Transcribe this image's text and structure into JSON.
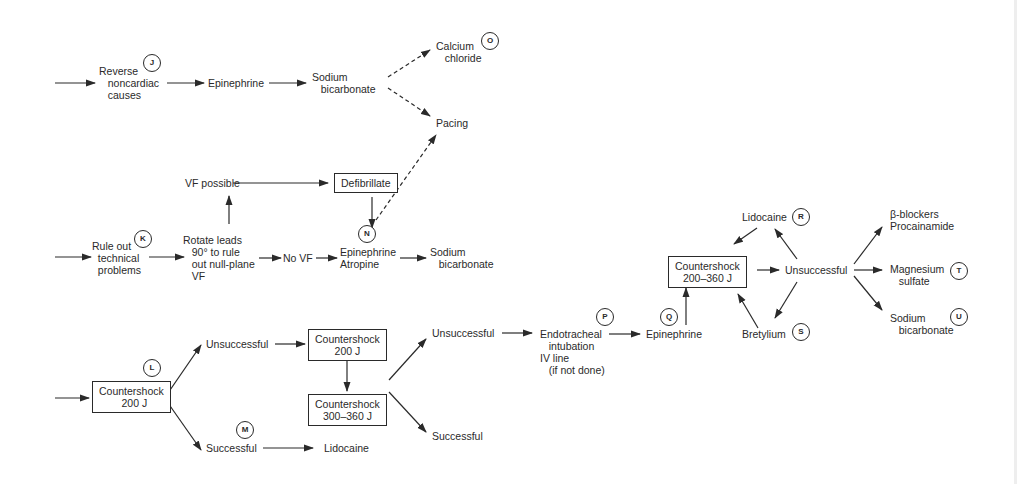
{
  "diagram": {
    "nodes": {
      "reverse_noncardiac": "Reverse\n   noncardiac\n   causes",
      "epinephrine_top": "Epinephrine",
      "sodium_bicarb_top": "Sodium\n   bicarbonate",
      "calcium_chloride": "Calcium\n   chloride",
      "pacing": "Pacing",
      "rule_out": "Rule out\n  technical\n  problems",
      "vf_possible": "VF possible",
      "defibrillate": "Defibrillate",
      "rotate_leads": "Rotate leads\n   90° to rule\n   out null-plane\n   VF",
      "no_vf": "No VF",
      "epi_atropine": "Epinephrine\nAtropine",
      "sodium_bicarb_mid": "Sodium\n   bicarbonate",
      "countershock_200_first": "Countershock\n  200 J",
      "unsuccessful_1": "Unsuccessful",
      "successful_1": "Successful",
      "lidocaine_bottom": "Lidocaine",
      "countershock_200_second": "Countershock\n200 J",
      "countershock_300_360": "Countershock\n300–360 J",
      "unsuccessful_2": "Unsuccessful",
      "successful_2": "Successful",
      "endotracheal": "Endotracheal\n   intubation\nIV line\n   (if not done)",
      "epinephrine_q": "Epinephrine",
      "countershock_200_360": "Countershock\n200–360 J",
      "lidocaine_r": "Lidocaine",
      "unsuccessful_3": "Unsuccessful",
      "bretylium": "Bretylium",
      "beta_blockers": "β-blockers\nProcainamide",
      "magnesium_sulfate": "Magnesium\n   sulfate",
      "sodium_bicarb_u": "Sodium\n   bicarbonate"
    },
    "badges": {
      "J": "J",
      "K": "K",
      "L": "L",
      "M": "M",
      "N": "N",
      "O": "O",
      "P": "P",
      "Q": "Q",
      "R": "R",
      "S": "S",
      "T": "T",
      "U": "U"
    },
    "colors": {
      "ink": "#2a2a2a",
      "background": "#ffffff",
      "edge_strip": "#eeeeee"
    }
  }
}
